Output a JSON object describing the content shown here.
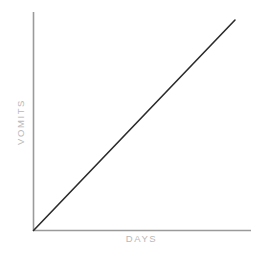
{
  "chart_data": {
    "type": "line",
    "title": "",
    "subtitle": "",
    "xlabel": "DAYS",
    "ylabel": "VOMITS",
    "x": [
      0,
      1
    ],
    "series": [
      {
        "name": "vomits-over-days",
        "values": [
          0,
          1
        ],
        "points": [
          [
            0,
            0
          ],
          [
            1,
            1
          ]
        ],
        "color": "#2b2b2b",
        "line_width": 1.6
      }
    ],
    "xlim": [
      0,
      1
    ],
    "ylim": [
      0,
      1
    ],
    "xticks": [],
    "yticks": [],
    "xtick_labels": [],
    "ytick_labels": [],
    "grid": false,
    "legend": false,
    "legend_position": "none",
    "annotations": [],
    "axis_color": "#9a9a9a",
    "label_color": "#b9b9b9",
    "background_color": "#ffffff",
    "trend": "linear increasing",
    "slope": 1.0
  },
  "axes": {
    "x_axis_name": "x-axis-line",
    "y_axis_name": "y-axis-line"
  }
}
